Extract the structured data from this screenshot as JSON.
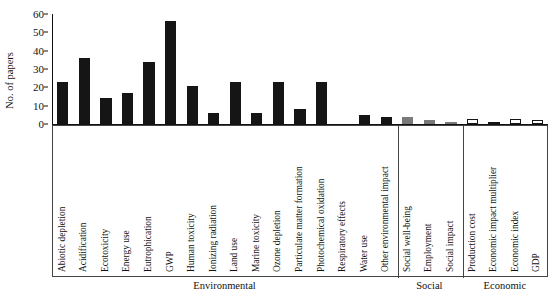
{
  "chart_data": {
    "type": "bar",
    "title": "",
    "xlabel": "",
    "ylabel": "No. of papers",
    "ylim": [
      0,
      60
    ],
    "ytick_values": [
      0,
      10,
      20,
      30,
      40,
      50,
      60
    ],
    "grid": false,
    "legend": "none",
    "categories": [
      "Abiotic depletion",
      "Acidification",
      "Ecotoxicity",
      "Energy use",
      "Eutrophication",
      "GWP",
      "Human toxicity",
      "Ionizing radiation",
      "Land use",
      "Marine toxicity",
      "Ozone depletion",
      "Particulate matter formation",
      "Photochemical oxidation",
      "Respiratory effects",
      "Water use",
      "Other environmental impact",
      "Social well-being",
      "Employment",
      "Social impact",
      "Production cost",
      "Economic impact multiplier",
      "Economic index",
      "GDP"
    ],
    "values": [
      23,
      36,
      14,
      17,
      34,
      56,
      21,
      6,
      23,
      6,
      23,
      8,
      23,
      0,
      5,
      4,
      4,
      2,
      1,
      3,
      1,
      3,
      2
    ],
    "groups": [
      {
        "name": "Environmental",
        "start": 0,
        "count": 16,
        "color": "#151515",
        "style": "filled-black"
      },
      {
        "name": "Social",
        "start": 16,
        "count": 3,
        "color": "#7a7a7a",
        "style": "filled-gray"
      },
      {
        "name": "Economic",
        "start": 19,
        "count": 4,
        "color": "#ffffff",
        "style": "hollow-outline"
      }
    ]
  },
  "axis": {
    "y_title": "No. of papers"
  }
}
